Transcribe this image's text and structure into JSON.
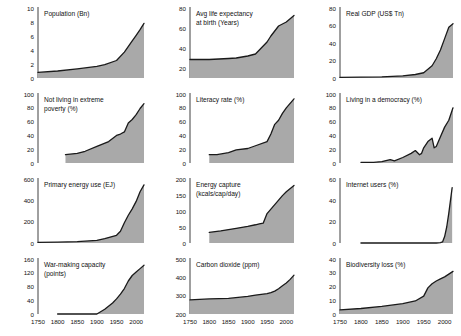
{
  "figure": {
    "title": "",
    "panel_count": 12,
    "fill_color": "#a9a9a9",
    "line_color": "#1a1a1a",
    "axis_color": "#2b2b2b",
    "background": "#ffffff",
    "xlabels": [
      "1750",
      "1800",
      "1850",
      "1900",
      "1950",
      "2000"
    ],
    "xlim": [
      1750,
      2020
    ]
  },
  "chart_data": [
    {
      "type": "area",
      "title": "Population (Bn)",
      "xlabel": "",
      "ylabel": "",
      "xlim": [
        1750,
        2020
      ],
      "ylim": [
        0,
        10
      ],
      "yticks": [
        0,
        2,
        4,
        6,
        8,
        10
      ],
      "xticks": [
        1750,
        1800,
        1850,
        1900,
        1950,
        2000
      ],
      "show_xticklabels": false,
      "grid": false,
      "x": [
        1750,
        1800,
        1850,
        1900,
        1920,
        1950,
        1970,
        1990,
        2000,
        2010,
        2020
      ],
      "values": [
        0.8,
        1.0,
        1.3,
        1.65,
        1.9,
        2.5,
        3.7,
        5.3,
        6.1,
        6.9,
        7.8
      ]
    },
    {
      "type": "area",
      "title": "Avg life expectancy at birth (Years)",
      "title_lines": [
        "Avg life expectancy",
        "at birth (Years)"
      ],
      "xlabel": "",
      "ylabel": "",
      "xlim": [
        1750,
        2020
      ],
      "ylim": [
        10,
        80
      ],
      "yticks": [
        20,
        40,
        60,
        80
      ],
      "xticks": [
        1750,
        1800,
        1850,
        1900,
        1950,
        2000
      ],
      "show_xticklabels": false,
      "grid": false,
      "x": [
        1750,
        1800,
        1850,
        1870,
        1900,
        1920,
        1950,
        1960,
        1980,
        2000,
        2020
      ],
      "values": [
        28.5,
        28.5,
        29.5,
        30,
        32,
        34,
        46,
        52,
        62,
        66,
        72.5
      ]
    },
    {
      "type": "area",
      "title": "Real GDP (US$ Tn)",
      "xlabel": "",
      "ylabel": "",
      "xlim": [
        1750,
        2020
      ],
      "ylim": [
        0,
        80
      ],
      "yticks": [
        0,
        20,
        40,
        60,
        80
      ],
      "xticks": [
        1750,
        1800,
        1850,
        1900,
        1950,
        2000
      ],
      "show_xticklabels": false,
      "grid": false,
      "x": [
        1750,
        1800,
        1850,
        1900,
        1930,
        1950,
        1970,
        1980,
        1990,
        2000,
        2010,
        2020
      ],
      "values": [
        0.7,
        0.9,
        1.3,
        2.5,
        4.0,
        6.0,
        14,
        22,
        32,
        45,
        58,
        62
      ]
    },
    {
      "type": "area",
      "title": "Not living in extreme poverty (%)",
      "title_lines": [
        "Not living in extreme",
        "poverty (%)"
      ],
      "xlabel": "",
      "ylabel": "",
      "xlim": [
        1750,
        2020
      ],
      "ylim": [
        0,
        100
      ],
      "yticks": [
        0,
        20,
        40,
        60,
        80,
        100
      ],
      "xticks": [
        1750,
        1800,
        1850,
        1900,
        1950,
        2000
      ],
      "show_xticklabels": false,
      "grid": false,
      "x": [
        1820,
        1850,
        1870,
        1900,
        1930,
        1950,
        1960,
        1970,
        1980,
        1990,
        2000,
        2010,
        2020
      ],
      "values": [
        12,
        14,
        17,
        24,
        31,
        40,
        42,
        45,
        58,
        63,
        70,
        79,
        86
      ]
    },
    {
      "type": "area",
      "title": "Literacy rate (%)",
      "xlabel": "",
      "ylabel": "",
      "xlim": [
        1750,
        2020
      ],
      "ylim": [
        0,
        100
      ],
      "yticks": [
        0,
        20,
        40,
        60,
        80,
        100
      ],
      "xticks": [
        1750,
        1800,
        1850,
        1900,
        1950,
        2000
      ],
      "show_xticklabels": false,
      "grid": false,
      "x": [
        1800,
        1820,
        1850,
        1870,
        1900,
        1920,
        1950,
        1960,
        1970,
        1980,
        1990,
        2000,
        2020
      ],
      "values": [
        12,
        12,
        15,
        19,
        21,
        25,
        31,
        42,
        56,
        62,
        72,
        80,
        93
      ]
    },
    {
      "type": "area",
      "title": "Living in a democracy (%)",
      "xlabel": "",
      "ylabel": "",
      "xlim": [
        1750,
        2020
      ],
      "ylim": [
        0,
        100
      ],
      "yticks": [
        0,
        20,
        40,
        60,
        80,
        100
      ],
      "xticks": [
        1750,
        1800,
        1850,
        1900,
        1950,
        2000
      ],
      "show_xticklabels": false,
      "grid": false,
      "x": [
        1800,
        1830,
        1850,
        1870,
        1880,
        1900,
        1920,
        1930,
        1940,
        1945,
        1950,
        1960,
        1970,
        1975,
        1980,
        1990,
        2000,
        2010,
        2020
      ],
      "values": [
        1,
        1,
        2,
        5,
        3,
        8,
        14,
        18,
        12,
        14,
        22,
        31,
        36,
        22,
        24,
        38,
        52,
        62,
        80
      ]
    },
    {
      "type": "area",
      "title": "Primary energy use (EJ)",
      "xlabel": "",
      "ylabel": "",
      "xlim": [
        1750,
        2020
      ],
      "ylim": [
        0,
        600
      ],
      "yticks": [
        0,
        200,
        400,
        600
      ],
      "xticks": [
        1750,
        1800,
        1850,
        1900,
        1950,
        2000
      ],
      "show_xticklabels": false,
      "grid": false,
      "x": [
        1750,
        1800,
        1850,
        1900,
        1920,
        1950,
        1960,
        1970,
        1980,
        1990,
        2000,
        2010,
        2020
      ],
      "values": [
        6,
        8,
        12,
        25,
        42,
        72,
        110,
        190,
        260,
        320,
        390,
        480,
        545
      ]
    },
    {
      "type": "area",
      "title": "Energy capture (kcals/cap/day)",
      "title_lines": [
        "Energy capture",
        "(kcals/cap/day)"
      ],
      "xlabel": "",
      "ylabel": "",
      "xlim": [
        1750,
        2020
      ],
      "ylim": [
        0,
        200
      ],
      "yticks": [
        0,
        50,
        100,
        150,
        200
      ],
      "xticks": [
        1750,
        1800,
        1850,
        1900,
        1950,
        2000
      ],
      "show_xticklabels": false,
      "grid": false,
      "x": [
        1800,
        1830,
        1850,
        1870,
        1900,
        1920,
        1930,
        1940,
        1950,
        1970,
        1990,
        2000,
        2020
      ],
      "values": [
        33,
        38,
        42,
        46,
        52,
        57,
        60,
        62,
        92,
        120,
        148,
        160,
        180
      ]
    },
    {
      "type": "area",
      "title": "Internet users (%)",
      "xlabel": "",
      "ylabel": "",
      "xlim": [
        1750,
        2020
      ],
      "ylim": [
        0,
        60
      ],
      "yticks": [
        0,
        20,
        40,
        60
      ],
      "xticks": [
        1750,
        1800,
        1850,
        1900,
        1950,
        2000
      ],
      "show_xticklabels": false,
      "grid": false,
      "x": [
        1800,
        1900,
        1950,
        1980,
        1990,
        1995,
        2000,
        2005,
        2010,
        2015,
        2018
      ],
      "values": [
        0,
        0,
        0,
        0,
        0.3,
        1,
        6,
        15,
        28,
        43,
        52
      ]
    },
    {
      "type": "area",
      "title": "War-making capacity (points)",
      "title_lines": [
        "War-making capacity",
        "(points)"
      ],
      "xlabel": "",
      "ylabel": "",
      "xlim": [
        1750,
        2020
      ],
      "ylim": [
        0,
        160
      ],
      "yticks": [
        0,
        40,
        80,
        120,
        160
      ],
      "xticks": [
        1750,
        1800,
        1850,
        1900,
        1950,
        2000
      ],
      "show_xticklabels": true,
      "grid": false,
      "x": [
        1800,
        1850,
        1900,
        1920,
        1940,
        1950,
        1960,
        1970,
        1980,
        1990,
        2000,
        2010,
        2020
      ],
      "values": [
        0,
        0,
        0,
        14,
        32,
        44,
        58,
        74,
        96,
        112,
        122,
        132,
        142
      ]
    },
    {
      "type": "area",
      "title": "Carbon dioxide (ppm)",
      "xlabel": "",
      "ylabel": "",
      "xlim": [
        1750,
        2020
      ],
      "ylim": [
        200,
        500
      ],
      "yticks": [
        200,
        300,
        400,
        500
      ],
      "xticks": [
        1750,
        1800,
        1850,
        1900,
        1950,
        2000
      ],
      "show_xticklabels": true,
      "grid": false,
      "x": [
        1750,
        1800,
        1850,
        1900,
        1920,
        1950,
        1960,
        1970,
        1980,
        1990,
        2000,
        2010,
        2020
      ],
      "values": [
        277,
        282,
        285,
        296,
        303,
        311,
        317,
        325,
        338,
        354,
        369,
        389,
        412
      ]
    },
    {
      "type": "area",
      "title": "Biodiversity loss (%)",
      "xlabel": "",
      "ylabel": "",
      "xlim": [
        1750,
        2020
      ],
      "ylim": [
        0,
        40
      ],
      "yticks": [
        0,
        10,
        20,
        30,
        40
      ],
      "xticks": [
        1750,
        1800,
        1850,
        1900,
        1950,
        2000
      ],
      "show_xticklabels": true,
      "grid": false,
      "x": [
        1750,
        1800,
        1850,
        1900,
        1930,
        1950,
        1960,
        1970,
        1980,
        1990,
        2000,
        2010,
        2020
      ],
      "values": [
        3,
        4,
        5.5,
        7.5,
        9.5,
        13,
        19,
        22,
        24,
        25.5,
        27,
        29,
        31
      ]
    }
  ]
}
